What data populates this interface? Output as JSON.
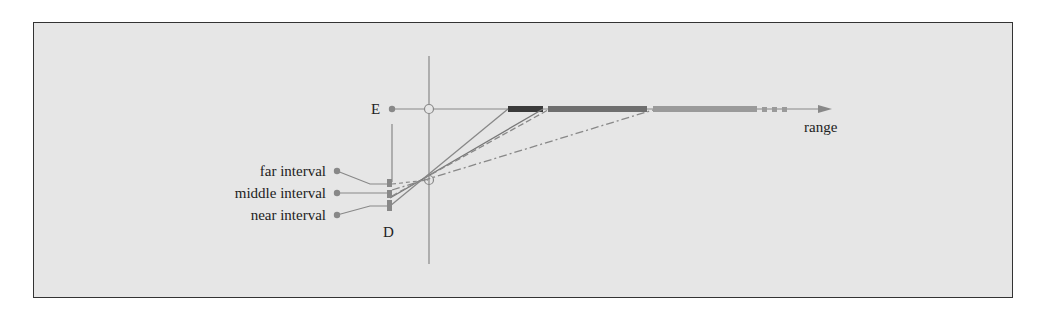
{
  "diagram": {
    "labels": {
      "E": "E",
      "D": "D",
      "range": "range",
      "far": "far interval",
      "middle": "middle interval",
      "near": "near interval"
    },
    "colors": {
      "background": "#e6e6e6",
      "frame": "#333333",
      "line": "#808080",
      "near_segment": "#3a3a3a",
      "middle_segment": "#6e6e6e",
      "far_segment": "#999999",
      "dot": "#808080"
    }
  }
}
